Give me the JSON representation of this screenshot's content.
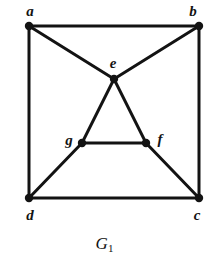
{
  "figure": {
    "caption_main": "G",
    "caption_subscript": "1",
    "caption_full": "G1",
    "background_color": "#ffffff",
    "ink_color": "#131313"
  },
  "chart_data": {
    "type": "diagram",
    "diagram_kind": "undirected-graph",
    "title": "G1",
    "background": "#ffffff",
    "stroke_color": "#131313",
    "edge_width": 3,
    "vertex_radius": 4.2,
    "canvas": {
      "width": 209,
      "height": 270
    },
    "nodes": [
      {
        "id": "a",
        "label": "a",
        "x": 29,
        "y": 26,
        "label_x": 30,
        "label_y": 11,
        "degree": 3
      },
      {
        "id": "b",
        "label": "b",
        "x": 199,
        "y": 26,
        "label_x": 193,
        "label_y": 11,
        "degree": 3
      },
      {
        "id": "c",
        "label": "c",
        "x": 199,
        "y": 198,
        "label_x": 197,
        "label_y": 215,
        "degree": 3
      },
      {
        "id": "d",
        "label": "d",
        "x": 29,
        "y": 198,
        "label_x": 30,
        "label_y": 215,
        "degree": 3
      },
      {
        "id": "e",
        "label": "e",
        "x": 114,
        "y": 79,
        "label_x": 113,
        "label_y": 63,
        "degree": 4
      },
      {
        "id": "f",
        "label": "f",
        "x": 146,
        "y": 143,
        "label_x": 160,
        "label_y": 139,
        "degree": 3
      },
      {
        "id": "g",
        "label": "g",
        "x": 82,
        "y": 143,
        "label_x": 69,
        "label_y": 140,
        "degree": 3
      }
    ],
    "edges": [
      {
        "from": "a",
        "to": "b"
      },
      {
        "from": "a",
        "to": "d"
      },
      {
        "from": "b",
        "to": "c"
      },
      {
        "from": "d",
        "to": "c"
      },
      {
        "from": "a",
        "to": "e"
      },
      {
        "from": "b",
        "to": "e"
      },
      {
        "from": "e",
        "to": "g"
      },
      {
        "from": "e",
        "to": "f"
      },
      {
        "from": "g",
        "to": "f"
      },
      {
        "from": "g",
        "to": "d"
      },
      {
        "from": "f",
        "to": "c"
      }
    ],
    "node_count": 7,
    "edge_count": 11
  }
}
